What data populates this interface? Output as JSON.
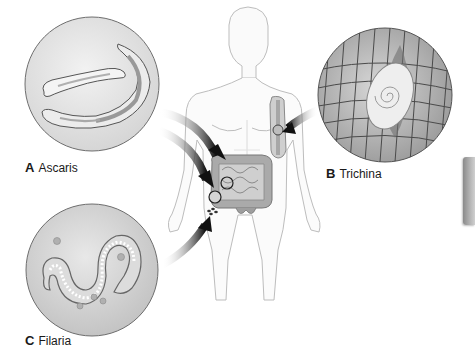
{
  "figure": {
    "type": "medical illustration"
  },
  "panels": [
    {
      "letter": "A",
      "name": "Ascaris",
      "site": "small intestine"
    },
    {
      "letter": "B",
      "name": "Trichina",
      "site": "skeletal muscle (upper arm)"
    },
    {
      "letter": "C",
      "name": "Filaria",
      "site": "lymphatics / blood"
    }
  ],
  "colors": {
    "background": "#ffffff",
    "circle_fill": "#e2e2e2",
    "circle_stroke": "#6e6e6e",
    "body_outline": "#bdbdbd",
    "intestine": "#9c9c9c",
    "arrow": "#1a1a1a",
    "label_text": "#1a1a1a",
    "side_tab": "#a0a0a0"
  }
}
